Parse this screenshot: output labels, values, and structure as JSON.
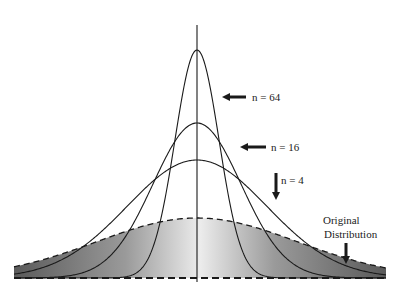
{
  "chart_data": {
    "type": "line",
    "title": "",
    "xlabel": "",
    "ylabel": "",
    "series": [
      {
        "name": "n = 64",
        "peak_y_px": 50,
        "sigma_px": 22,
        "style": "solid"
      },
      {
        "name": "n = 16",
        "peak_y_px": 123,
        "sigma_px": 44,
        "style": "solid"
      },
      {
        "name": "n = 4",
        "peak_y_px": 160,
        "sigma_px": 70,
        "style": "solid"
      },
      {
        "name": "Original Distribution",
        "peak_y_px": 218,
        "sigma_px": 100,
        "style": "dashed",
        "shaded": true
      }
    ],
    "annotations": [
      {
        "text": "n = 64",
        "arrow": "left"
      },
      {
        "text": "n = 16",
        "arrow": "left"
      },
      {
        "text": "n = 4",
        "arrow": "down"
      },
      {
        "text": "Original",
        "line2": "Distribution",
        "arrow": "down"
      }
    ],
    "grid": false,
    "legend": "none"
  },
  "labels": {
    "n64": "n = 64",
    "n16": "n = 16",
    "n4": "n = 4",
    "orig1": "Original",
    "orig2": "Distribution"
  },
  "colors": {
    "line": "#1a1a1a",
    "shade_dark": "#6e6e6e",
    "shade_light": "#e4e4e4"
  }
}
